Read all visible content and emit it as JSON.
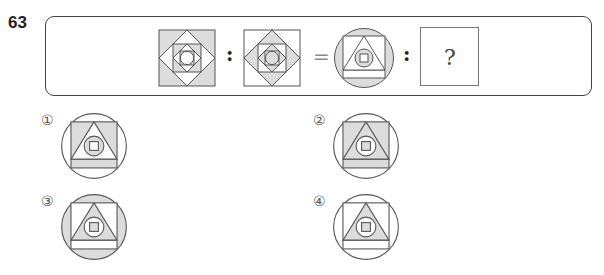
{
  "question": {
    "number": "63",
    "analogy": {
      "ratio_symbol": ":",
      "equals_symbol": "=",
      "unknown_symbol": "?",
      "figure_a": {
        "description": "nested square-diamond pattern, outer square shaded",
        "layers": [
          "square:shaded",
          "diamond:white",
          "square:shaded",
          "diamond:white",
          "square:shaded",
          "circle:white"
        ]
      },
      "figure_b": {
        "description": "nested square-diamond pattern, shading inverted",
        "layers": [
          "square:white",
          "diamond:shaded",
          "square:white",
          "diamond:shaded",
          "square:white",
          "circle:shaded"
        ]
      },
      "figure_c": {
        "description": "circle, square, triangle, circle, small square",
        "layers": [
          "circle:shaded",
          "square:white",
          "triangle:white",
          "circle:shaded",
          "small-square:white"
        ]
      }
    },
    "options": [
      {
        "label": "①",
        "layers": [
          "circle:white",
          "square:shaded",
          "triangle:white",
          "circle:shaded",
          "small-square:white"
        ]
      },
      {
        "label": "②",
        "layers": [
          "circle:white",
          "square:shaded",
          "triangle:shaded",
          "circle:white",
          "small-square:shaded"
        ]
      },
      {
        "label": "③",
        "layers": [
          "circle:shaded",
          "square:white",
          "triangle:shaded",
          "circle:white",
          "small-square:shaded"
        ]
      },
      {
        "label": "④",
        "layers": [
          "circle:white",
          "square:white",
          "triangle:shaded",
          "circle:white",
          "small-square:shaded"
        ]
      }
    ]
  },
  "colors": {
    "shaded": "#dcdcdc",
    "white": "#ffffff",
    "stroke": "#555555"
  }
}
